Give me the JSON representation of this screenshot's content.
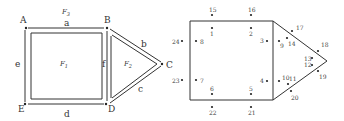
{
  "left_diagram": {
    "vertices": [
      {
        "name": "A",
        "x": 26,
        "y": 28,
        "lx": 20,
        "ly": 23
      },
      {
        "name": "B",
        "x": 107,
        "y": 28,
        "lx": 104,
        "ly": 23
      },
      {
        "name": "C",
        "x": 162,
        "y": 64,
        "lx": 166,
        "ly": 68
      },
      {
        "name": "D",
        "x": 106,
        "y": 104,
        "lx": 108,
        "ly": 112
      },
      {
        "name": "E",
        "x": 25,
        "y": 104,
        "lx": 18,
        "ly": 112
      }
    ],
    "faces": [
      {
        "label": "F3",
        "main": "F",
        "sub": "3",
        "x": 62,
        "y": 14
      },
      {
        "label": "F1",
        "main": "F",
        "sub": "1",
        "x": 60,
        "y": 66
      },
      {
        "label": "F2",
        "main": "F",
        "sub": "2",
        "x": 124,
        "y": 66
      }
    ],
    "edges": [
      {
        "label": "a",
        "x": 64,
        "y": 26
      },
      {
        "label": "b",
        "x": 141,
        "y": 47
      },
      {
        "label": "c",
        "x": 138,
        "y": 92
      },
      {
        "label": "d",
        "x": 64,
        "y": 117
      },
      {
        "label": "e",
        "x": 15,
        "y": 67
      },
      {
        "label": "f",
        "x": 102,
        "y": 67
      }
    ]
  },
  "right_diagram": {
    "outline": "190,21 273,21 327,61 273,100 190,100",
    "points": [
      {
        "label": "1",
        "x": 212,
        "y": 28,
        "lx": 210,
        "ly": 36
      },
      {
        "label": "2",
        "x": 251,
        "y": 28,
        "lx": 249,
        "ly": 36
      },
      {
        "label": "3",
        "x": 267,
        "y": 41,
        "lx": 260,
        "ly": 43
      },
      {
        "label": "4",
        "x": 267,
        "y": 81,
        "lx": 260,
        "ly": 83
      },
      {
        "label": "5",
        "x": 251,
        "y": 94,
        "lx": 249,
        "ly": 91
      },
      {
        "label": "6",
        "x": 212,
        "y": 94,
        "lx": 210,
        "ly": 91
      },
      {
        "label": "7",
        "x": 196,
        "y": 80,
        "lx": 200,
        "ly": 83
      },
      {
        "label": "8",
        "x": 196,
        "y": 41,
        "lx": 200,
        "ly": 44
      },
      {
        "label": "9",
        "x": 279,
        "y": 41,
        "lx": 280,
        "ly": 48
      },
      {
        "label": "10",
        "x": 279,
        "y": 81,
        "lx": 282,
        "ly": 80
      },
      {
        "label": "11",
        "x": 288,
        "y": 84,
        "lx": 289,
        "ly": 81
      },
      {
        "label": "12",
        "x": 312,
        "y": 65,
        "lx": 304,
        "ly": 67
      },
      {
        "label": "13",
        "x": 312,
        "y": 58,
        "lx": 304,
        "ly": 61
      },
      {
        "label": "14",
        "x": 287,
        "y": 38,
        "lx": 288,
        "ly": 46
      },
      {
        "label": "17",
        "x": 292,
        "y": 31,
        "lx": 296,
        "ly": 30
      },
      {
        "label": "18",
        "x": 318,
        "y": 51,
        "lx": 321,
        "ly": 47
      },
      {
        "label": "19",
        "x": 318,
        "y": 71,
        "lx": 319,
        "ly": 79
      },
      {
        "label": "20",
        "x": 291,
        "y": 91,
        "lx": 291,
        "ly": 100
      },
      {
        "label": "15",
        "x": 212,
        "y": 15,
        "lx": 209,
        "ly": 12
      },
      {
        "label": "16",
        "x": 251,
        "y": 15,
        "lx": 248,
        "ly": 12
      },
      {
        "label": "21",
        "x": 251,
        "y": 107,
        "lx": 248,
        "ly": 115
      },
      {
        "label": "22",
        "x": 212,
        "y": 107,
        "lx": 209,
        "ly": 115
      },
      {
        "label": "23",
        "x": 182,
        "y": 80,
        "lx": 172,
        "ly": 83
      },
      {
        "label": "24",
        "x": 182,
        "y": 41,
        "lx": 172,
        "ly": 44
      }
    ]
  }
}
